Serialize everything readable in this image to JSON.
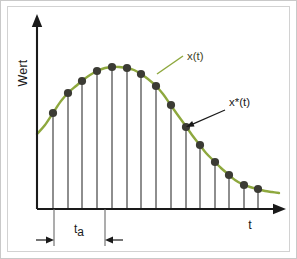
{
  "figure": {
    "background_color": "#ffffff",
    "frame_color": "#c9c9c9"
  },
  "axes": {
    "y_label": "Wert",
    "x_label": "t",
    "axis_color": "#1a1a1a",
    "y_axis_x": 36,
    "x_axis_y": 208,
    "y_axis_top": 13,
    "x_axis_right": 285
  },
  "annotations": [
    {
      "id": "continuous-signal",
      "label": "x(t)",
      "color": "#3f4426",
      "leader_color": "#8ea83e",
      "text_x": 186,
      "text_y": 59,
      "leader_from_x": 182,
      "leader_from_y": 55,
      "leader_to_x": 156,
      "leader_to_y": 73
    },
    {
      "id": "sampled-signal",
      "label": "x*(t)",
      "color": "#1a1a1a",
      "leader_color": "#1a1a1a",
      "text_x": 228,
      "text_y": 105,
      "leader_from_x": 224,
      "leader_from_y": 109,
      "leader_to_x": 185,
      "leader_to_y": 126
    }
  ],
  "dimension": {
    "id": "sampling-interval",
    "label": "t",
    "subscript": "a",
    "label_x": 78,
    "label_y": 232,
    "line_y": 239,
    "left_x": 53,
    "right_x": 104,
    "extension_top": 208,
    "extension_bottom": 245,
    "description": "Abtastintervall t_a zwischen zwei Abtastpunkten"
  },
  "chart_data": {
    "type": "line",
    "title": "",
    "xlabel": "t",
    "ylabel": "Wert",
    "grid": false,
    "legend": [
      "x(t)",
      "x*(t)"
    ],
    "curve_color": "#8ea83e",
    "sample_color": "#3b3b34",
    "stem_color": "#4a4a4a",
    "baseline_y": 208,
    "curve_points": [
      [
        36,
        133
      ],
      [
        44,
        124
      ],
      [
        52,
        112
      ],
      [
        60,
        100
      ],
      [
        68,
        91
      ],
      [
        75,
        85
      ],
      [
        82,
        79
      ],
      [
        89,
        74
      ],
      [
        96,
        70
      ],
      [
        104,
        67
      ],
      [
        111,
        66
      ],
      [
        118,
        66
      ],
      [
        126,
        67
      ],
      [
        133,
        69
      ],
      [
        140,
        73
      ],
      [
        147,
        78
      ],
      [
        155,
        85
      ],
      [
        162,
        93
      ],
      [
        169,
        103
      ],
      [
        176,
        113
      ],
      [
        184,
        124
      ],
      [
        191,
        134
      ],
      [
        198,
        143
      ],
      [
        205,
        152
      ],
      [
        213,
        160
      ],
      [
        220,
        167
      ],
      [
        227,
        173
      ],
      [
        234,
        179
      ],
      [
        241,
        183
      ],
      [
        249,
        186
      ],
      [
        256,
        188
      ],
      [
        264,
        190
      ],
      [
        271,
        191
      ],
      [
        278,
        192
      ]
    ],
    "samples": [
      {
        "index": 0,
        "x": 52,
        "y": 112
      },
      {
        "index": 1,
        "x": 67,
        "y": 92
      },
      {
        "index": 2,
        "x": 81,
        "y": 80
      },
      {
        "index": 3,
        "x": 96,
        "y": 70
      },
      {
        "index": 4,
        "x": 111,
        "y": 66
      },
      {
        "index": 5,
        "x": 126,
        "y": 67
      },
      {
        "index": 6,
        "x": 140,
        "y": 73
      },
      {
        "index": 7,
        "x": 155,
        "y": 85
      },
      {
        "index": 8,
        "x": 170,
        "y": 104
      },
      {
        "index": 9,
        "x": 185,
        "y": 126
      },
      {
        "index": 10,
        "x": 199,
        "y": 144
      },
      {
        "index": 11,
        "x": 214,
        "y": 161
      },
      {
        "index": 12,
        "x": 228,
        "y": 174
      },
      {
        "index": 13,
        "x": 243,
        "y": 184
      },
      {
        "index": 14,
        "x": 257,
        "y": 188
      }
    ]
  }
}
